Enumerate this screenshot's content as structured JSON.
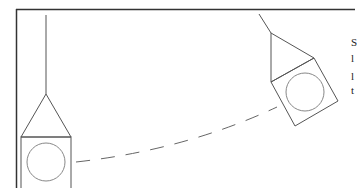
{
  "diagram": {
    "type": "pendulum-swing",
    "colors": {
      "frame": "#333333",
      "lines": "#555555",
      "circle": "#888888",
      "dashed": "#666666"
    },
    "left_pendulum": {
      "label": "pendulum-at-rest"
    },
    "right_pendulum": {
      "label": "pendulum-swung"
    },
    "path": {
      "style": "dashed",
      "label": "swing-arc"
    },
    "caption_lines": [
      "S",
      "l",
      "l",
      "t"
    ]
  }
}
